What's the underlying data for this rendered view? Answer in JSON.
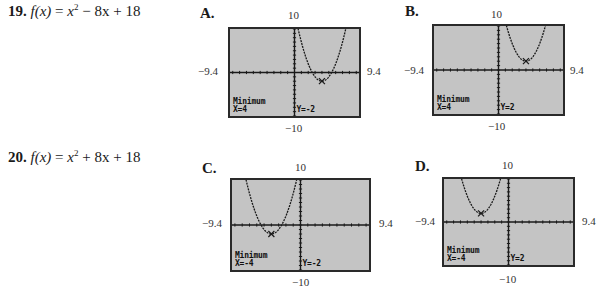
{
  "problems": [
    {
      "number": "19.",
      "func_name": "f(x)",
      "expr_a": "x",
      "exp": "2",
      "expr_b": " − 8x + 18"
    },
    {
      "number": "20.",
      "func_name": "f(x)",
      "expr_a": "x",
      "exp": "2",
      "expr_b": " + 8x + 18"
    }
  ],
  "window": {
    "xmin_label": "−9.4",
    "xmax_label": "9.4",
    "ymax_label": "10",
    "ymin_label": "−10"
  },
  "choices": [
    {
      "letter": "A.",
      "min_label": "Minimum",
      "x_readout": "X=4",
      "y_readout": "Y=-2"
    },
    {
      "letter": "B.",
      "min_label": "Minimum",
      "x_readout": "X=4",
      "y_readout": "Y=2"
    },
    {
      "letter": "C.",
      "min_label": "Minimum",
      "x_readout": "X=-4",
      "y_readout": "Y=-2"
    },
    {
      "letter": "D.",
      "min_label": "Minimum",
      "x_readout": "X=-4",
      "y_readout": "Y=2"
    }
  ],
  "chart_data": [
    {
      "type": "line",
      "title": "A.",
      "function": "y = (x-4)^2 - 2",
      "vertex": [
        4,
        -2
      ],
      "xlim": [
        -9.4,
        9.4
      ],
      "ylim": [
        -10,
        10
      ],
      "xlabel": "",
      "ylabel": "",
      "tick_labels": {
        "left": "−9.4",
        "right": "9.4",
        "top": "10",
        "bottom": "−10"
      },
      "annotations": [
        "Minimum",
        "X=4",
        "Y=-2"
      ],
      "grid": false
    },
    {
      "type": "line",
      "title": "B.",
      "function": "y = (x-4)^2 + 2",
      "vertex": [
        4,
        2
      ],
      "xlim": [
        -9.4,
        9.4
      ],
      "ylim": [
        -10,
        10
      ],
      "xlabel": "",
      "ylabel": "",
      "tick_labels": {
        "left": "−9.4",
        "right": "9.4",
        "top": "10",
        "bottom": "−10"
      },
      "annotations": [
        "Minimum",
        "X=4",
        "Y=2"
      ],
      "grid": false
    },
    {
      "type": "line",
      "title": "C.",
      "function": "y = (x+4)^2 - 2",
      "vertex": [
        -4,
        -2
      ],
      "xlim": [
        -9.4,
        9.4
      ],
      "ylim": [
        -10,
        10
      ],
      "xlabel": "",
      "ylabel": "",
      "tick_labels": {
        "left": "−9.4",
        "right": "9.4",
        "top": "10",
        "bottom": "−10"
      },
      "annotations": [
        "Minimum",
        "X=-4",
        "Y=-2"
      ],
      "grid": false
    },
    {
      "type": "line",
      "title": "D.",
      "function": "y = (x+4)^2 + 2",
      "vertex": [
        -4,
        2
      ],
      "xlim": [
        -9.4,
        9.4
      ],
      "ylim": [
        -10,
        10
      ],
      "xlabel": "",
      "ylabel": "",
      "tick_labels": {
        "left": "−9.4",
        "right": "9.4",
        "top": "10",
        "bottom": "−10"
      },
      "annotations": [
        "Minimum",
        "X=-4",
        "Y=2"
      ],
      "grid": false
    }
  ]
}
